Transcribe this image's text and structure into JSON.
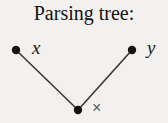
{
  "figure": {
    "title": "Parsing tree:",
    "background_color": "#f2f1ef",
    "ink_color": "#1b1915",
    "edge_color": "#3a3833",
    "operator_color": "#5a5853"
  },
  "tree": {
    "nodes": [
      {
        "id": "left-operand",
        "label": "x",
        "role": "leaf",
        "cx": 16,
        "cy": 50,
        "r": 4.2,
        "label_x": 32,
        "label_y": 38
      },
      {
        "id": "right-operand",
        "label": "y",
        "role": "leaf",
        "cx": 132,
        "cy": 50,
        "r": 4.2,
        "label_x": 147,
        "label_y": 38
      },
      {
        "id": "operator-root",
        "label": "×",
        "role": "root",
        "cx": 78,
        "cy": 110,
        "r": 4.2,
        "label_x": 92,
        "label_y": 100
      }
    ],
    "edges": [
      {
        "id": "edge-root-left",
        "from": "operator-root",
        "to": "left-operand",
        "x1": 78,
        "y1": 110,
        "x2": 16,
        "y2": 50
      },
      {
        "id": "edge-root-right",
        "from": "operator-root",
        "to": "right-operand",
        "x1": 78,
        "y1": 110,
        "x2": 132,
        "y2": 50
      }
    ]
  }
}
